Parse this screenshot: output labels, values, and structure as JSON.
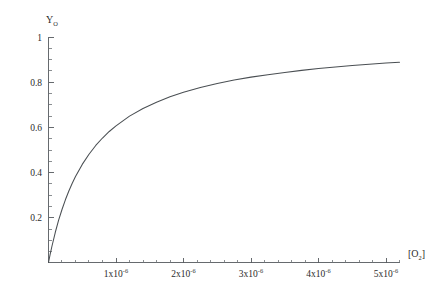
{
  "chart_data": {
    "type": "line",
    "title": "",
    "subtitle": "",
    "xlabel": "[O2]",
    "xlabel_base": "[O",
    "xlabel_sub": "2",
    "xlabel_close": "]",
    "ylabel": "YO",
    "ylabel_base": "Y",
    "ylabel_sub": "O",
    "xlim": [
      0,
      5.5e-06
    ],
    "ylim": [
      0,
      1
    ],
    "xlim_display": [
      "0",
      "5.5x10-6"
    ],
    "ylim_display": [
      "0",
      "1"
    ],
    "grid": false,
    "legend": false,
    "legend_position": "none",
    "axis_style": "bottom-left-open",
    "x_tick_labels": [
      "1x10-6",
      "2x10-6",
      "3x10-6",
      "4x10-6",
      "5x10-6"
    ],
    "x_tick_values": [
      1e-06,
      2e-06,
      3e-06,
      4e-06,
      5e-06
    ],
    "x_tick_mantissas": [
      "1x10",
      "2x10",
      "3x10",
      "4x10",
      "5x10"
    ],
    "x_tick_exponent": "-6",
    "x_minor_tick_step": 2e-07,
    "y_tick_labels": [
      "0.2",
      "0.4",
      "0.6",
      "0.8",
      "1"
    ],
    "y_tick_values": [
      0.2,
      0.4,
      0.6,
      0.8,
      1.0
    ],
    "y_minor_tick_step": 0.05,
    "series": [
      {
        "name": "oxygen binding saturation",
        "color": "#4a4f53",
        "x": [
          0,
          2.5e-08,
          5e-08,
          1e-07,
          1.5e-07,
          2e-07,
          2.5e-07,
          3e-07,
          3.5e-07,
          4e-07,
          5e-07,
          6e-07,
          7e-07,
          8e-07,
          9e-07,
          1e-06,
          1.2e-06,
          1.4e-06,
          1.6e-06,
          1.8e-06,
          2e-06,
          2.25e-06,
          2.5e-06,
          2.75e-06,
          3e-06,
          3.25e-06,
          3.5e-06,
          3.75e-06,
          4e-06,
          4.25e-06,
          4.5e-06,
          4.75e-06,
          5e-06,
          5.2e-06
        ],
        "y": [
          0.0,
          0.037,
          0.071,
          0.133,
          0.188,
          0.235,
          0.278,
          0.316,
          0.35,
          0.381,
          0.435,
          0.48,
          0.519,
          0.552,
          0.581,
          0.606,
          0.649,
          0.683,
          0.711,
          0.735,
          0.755,
          0.776,
          0.794,
          0.809,
          0.822,
          0.833,
          0.843,
          0.852,
          0.86,
          0.867,
          0.874,
          0.879,
          0.885,
          0.888
        ]
      }
    ],
    "model": {
      "equation": "Y = [O2] / ([O2] + Kd)",
      "Kd": 6.5e-07
    },
    "annotations": []
  }
}
